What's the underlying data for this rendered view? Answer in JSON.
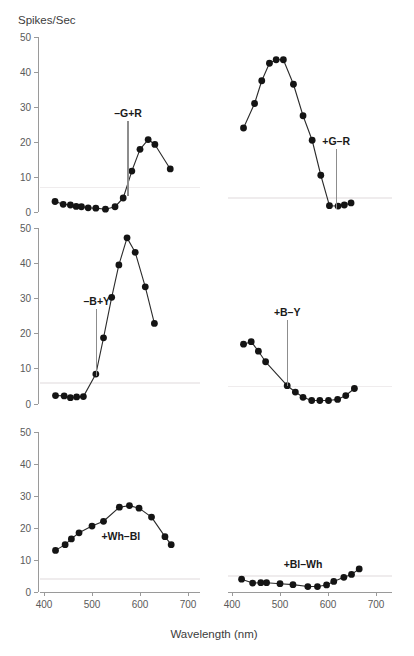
{
  "figure": {
    "y_axis_title": "Spikes/Sec",
    "x_axis_title": "Wavelength (nm)"
  },
  "chart_data": {
    "type": "line",
    "title": "Spikes/Sec",
    "xlabel": "Wavelength (nm)",
    "ylabel": "Spikes/Sec",
    "xlim": [
      390,
      720
    ],
    "ylim": [
      0,
      50
    ],
    "xticks": [
      400,
      500,
      600,
      700
    ],
    "yticks": [
      0,
      10,
      20,
      30,
      40,
      50
    ],
    "grid": false,
    "legend": "none",
    "layout": "3 rows x 2 columns of panels",
    "panels": [
      {
        "id": "panel-g-minus-r",
        "row": 1,
        "col": 1,
        "annotation": "–G+R",
        "annotation_x": 575,
        "y_axis_shown": true,
        "x_axis_shown": false,
        "baseline_level": 7,
        "x": [
          423,
          440,
          455,
          467,
          478,
          490,
          503,
          516,
          530,
          545,
          560,
          575,
          588,
          602,
          617,
          632,
          647,
          665
        ],
        "y": [
          3.0,
          2.2,
          2.0,
          1.6,
          1.5,
          1.2,
          1.1,
          0.8,
          1.5,
          4.0,
          11.7,
          17.9,
          20.7,
          19.3,
          12.3
        ],
        "series": [
          {
            "name": "–G+R cell response",
            "points": [
              [
                423,
                3.0
              ],
              [
                440,
                2.2
              ],
              [
                455,
                2.0
              ],
              [
                467,
                1.6
              ],
              [
                478,
                1.5
              ],
              [
                492,
                1.2
              ],
              [
                508,
                1.1
              ],
              [
                528,
                0.8
              ],
              [
                548,
                1.5
              ],
              [
                565,
                4.0
              ],
              [
                583,
                11.7
              ],
              [
                600,
                17.9
              ],
              [
                617,
                20.7
              ],
              [
                631,
                19.3
              ],
              [
                663,
                12.3
              ]
            ]
          }
        ]
      },
      {
        "id": "panel-plus-g-minus-r",
        "row": 1,
        "col": 2,
        "annotation": "+G–R",
        "annotation_x": 617,
        "y_axis_shown": false,
        "x_axis_shown": false,
        "baseline_level": 4,
        "series": [
          {
            "name": "+G–R cell response",
            "points": [
              [
                424,
                24.0
              ],
              [
                447,
                31.0
              ],
              [
                462,
                37.5
              ],
              [
                478,
                42.5
              ],
              [
                492,
                43.5
              ],
              [
                507,
                43.5
              ],
              [
                528,
                36.5
              ],
              [
                548,
                27.5
              ],
              [
                567,
                20.5
              ],
              [
                585,
                10.5
              ],
              [
                603,
                1.8
              ],
              [
                621,
                1.7
              ],
              [
                634,
                2.0
              ],
              [
                648,
                2.6
              ]
            ]
          }
        ]
      },
      {
        "id": "panel-b-minus-y",
        "row": 2,
        "col": 1,
        "annotation": "–B+Y",
        "annotation_x": 510,
        "y_axis_shown": true,
        "x_axis_shown": false,
        "baseline_level": 6,
        "series": [
          {
            "name": "–B+Y cell response",
            "points": [
              [
                424,
                2.4
              ],
              [
                442,
                2.3
              ],
              [
                455,
                1.8
              ],
              [
                468,
                2.0
              ],
              [
                482,
                2.1
              ],
              [
                508,
                8.5
              ],
              [
                524,
                18.8
              ],
              [
                541,
                30.3
              ],
              [
                556,
                39.5
              ],
              [
                573,
                47.2
              ],
              [
                590,
                43.1
              ],
              [
                611,
                33.3
              ],
              [
                630,
                22.9
              ]
            ]
          }
        ]
      },
      {
        "id": "panel-plus-b-minus-y",
        "row": 2,
        "col": 2,
        "annotation": "+B–Y",
        "annotation_x": 515,
        "y_axis_shown": false,
        "x_axis_shown": false,
        "baseline_level": 5,
        "series": [
          {
            "name": "+B–Y cell response",
            "points": [
              [
                424,
                17.0
              ],
              [
                440,
                17.7
              ],
              [
                455,
                15.0
              ],
              [
                470,
                12.0
              ],
              [
                515,
                5.2
              ],
              [
                532,
                3.4
              ],
              [
                548,
                1.9
              ],
              [
                566,
                1.0
              ],
              [
                583,
                1.0
              ],
              [
                601,
                1.0
              ],
              [
                620,
                1.3
              ],
              [
                637,
                2.4
              ],
              [
                655,
                4.4
              ]
            ]
          }
        ]
      },
      {
        "id": "panel-plus-wh-minus-bl",
        "row": 3,
        "col": 1,
        "annotation": "+Wh–Bl",
        "annotation_x": 560,
        "y_axis_shown": true,
        "x_axis_shown": true,
        "baseline_level": 4,
        "series": [
          {
            "name": "+Wh–Bl cell response",
            "points": [
              [
                424,
                13.0
              ],
              [
                444,
                14.8
              ],
              [
                457,
                16.6
              ],
              [
                473,
                18.5
              ],
              [
                500,
                20.6
              ],
              [
                524,
                22.1
              ],
              [
                557,
                26.5
              ],
              [
                578,
                27.0
              ],
              [
                598,
                26.2
              ],
              [
                624,
                23.4
              ],
              [
                652,
                17.3
              ],
              [
                665,
                14.8
              ]
            ]
          }
        ]
      },
      {
        "id": "panel-plus-bl-minus-wh",
        "row": 3,
        "col": 2,
        "annotation": "+Bl–Wh",
        "annotation_x": 548,
        "y_axis_shown": false,
        "x_axis_shown": true,
        "baseline_level": 5,
        "series": [
          {
            "name": "+Bl–Wh cell response",
            "points": [
              [
                420,
                4.0
              ],
              [
                443,
                2.8
              ],
              [
                460,
                2.9
              ],
              [
                472,
                2.9
              ],
              [
                500,
                2.6
              ],
              [
                527,
                2.3
              ],
              [
                558,
                1.7
              ],
              [
                578,
                1.7
              ],
              [
                597,
                2.2
              ],
              [
                612,
                3.3
              ],
              [
                633,
                4.6
              ],
              [
                649,
                5.5
              ],
              [
                665,
                7.2
              ]
            ]
          }
        ]
      }
    ]
  },
  "ticks": {
    "y_labels": [
      "0",
      "10",
      "20",
      "30",
      "40",
      "50"
    ],
    "x_labels": [
      "400",
      "500",
      "600",
      "700"
    ]
  }
}
